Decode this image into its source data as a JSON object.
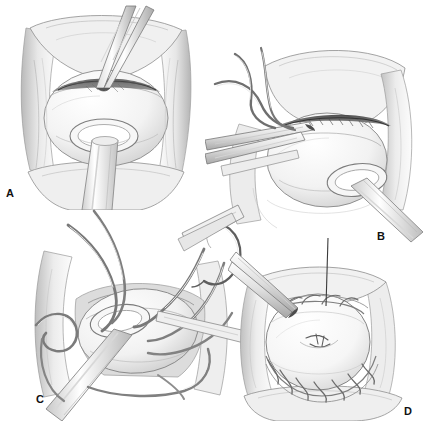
{
  "figure": {
    "background_color": "#ffffff",
    "ink_color": "#2b2b2b",
    "mid_tone_color": "#9a9a9a",
    "light_tone_color": "#d8d8d8",
    "width": 423,
    "height": 421
  },
  "panels": [
    {
      "id": "a",
      "label": "A",
      "caption": "Retracted operative field with spherical organ and catheter exiting through the opened neck; scissors dividing tissue at the superior margin",
      "position": {
        "x": 0,
        "y": 0,
        "width": 212,
        "height": 210
      },
      "label_position": {
        "x": 6,
        "y": 188
      },
      "instruments": [
        "scissors",
        "catheter",
        "retractor"
      ]
    },
    {
      "id": "b",
      "label": "B",
      "caption": "Oblique view with forceps elevating the posterior wall; suture strands held to the upper left, catheter exiting inferiorly",
      "position": {
        "x": 205,
        "y": 28,
        "width": 218,
        "height": 220
      },
      "label_position": {
        "x": 377,
        "y": 231
      },
      "instruments": [
        "forceps",
        "catheter",
        "sutures",
        "retractor"
      ]
    },
    {
      "id": "c",
      "label": "C",
      "caption": "Multiple interrupted sutures placed circumferentially around the anastomosis with curved needle at upper right; catheter draped across field",
      "position": {
        "x": 28,
        "y": 203,
        "width": 220,
        "height": 218
      },
      "label_position": {
        "x": 36,
        "y": 394
      },
      "instruments": [
        "curved-needle",
        "sutures",
        "catheter",
        "retractor"
      ]
    },
    {
      "id": "d",
      "label": "D",
      "caption": "Completed closure: the organ is closed with a continuous running suture line around the inferior circumference; forceps at upper left and a vertical suture tail",
      "position": {
        "x": 228,
        "y": 238,
        "width": 195,
        "height": 183
      },
      "label_position": {
        "x": 404,
        "y": 406
      },
      "instruments": [
        "forceps",
        "running-suture",
        "suture-tail"
      ]
    }
  ]
}
